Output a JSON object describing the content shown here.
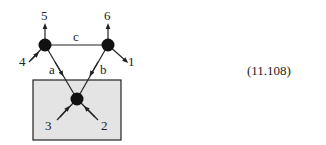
{
  "diagram": {
    "equation_number": "(11.108)",
    "colors": {
      "box_fill": "#e4e4e4",
      "box_stroke": "#222222",
      "node_fill": "#111111",
      "line": "#222222"
    },
    "nodes": [
      {
        "id": "top-left",
        "x": 45,
        "y": 45
      },
      {
        "id": "top-right",
        "x": 108,
        "y": 45
      },
      {
        "id": "bottom",
        "x": 77,
        "y": 99
      }
    ],
    "internal_edges": [
      {
        "label": "c",
        "from": "top-left",
        "to": "top-right"
      },
      {
        "label": "a",
        "from": "top-left",
        "to": "bottom"
      },
      {
        "label": "b",
        "from": "top-right",
        "to": "bottom"
      }
    ],
    "external_legs": [
      {
        "label": "1",
        "node": "top-right"
      },
      {
        "label": "2",
        "node": "bottom"
      },
      {
        "label": "3",
        "node": "bottom"
      },
      {
        "label": "4",
        "node": "top-left"
      },
      {
        "label": "5",
        "node": "top-left"
      },
      {
        "label": "6",
        "node": "top-right"
      }
    ],
    "labels": {
      "c": "c",
      "a": "a",
      "b": "b",
      "l1": "1",
      "l2": "2",
      "l3": "3",
      "l4": "4",
      "l5": "5",
      "l6": "6"
    }
  }
}
